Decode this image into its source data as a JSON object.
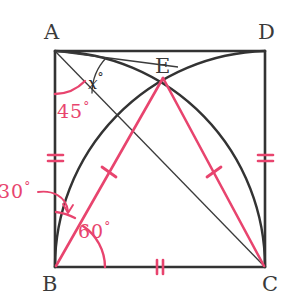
{
  "figure": {
    "type": "geometry-diagram",
    "colors": {
      "ink": "#333333",
      "accent_pink": "#e8446e",
      "background": "#ffffff"
    },
    "square": {
      "top_left": {
        "label": "A",
        "x": 55,
        "y": 51
      },
      "top_right": {
        "label": "D",
        "x": 265,
        "y": 51
      },
      "bottom_left": {
        "label": "B",
        "x": 55,
        "y": 267
      },
      "bottom_right": {
        "label": "C",
        "x": 265,
        "y": 267
      }
    },
    "point_e": {
      "label": "E",
      "x": 163,
      "y": 77
    },
    "vertex_labels": [
      {
        "name": "A",
        "text": "A",
        "x": 44,
        "y": 22
      },
      {
        "name": "D",
        "text": "D",
        "x": 258,
        "y": 22
      },
      {
        "name": "B",
        "text": "B",
        "x": 42,
        "y": 274
      },
      {
        "name": "C",
        "text": "C",
        "x": 262,
        "y": 274
      },
      {
        "name": "E",
        "text": "E",
        "x": 155,
        "y": 56
      }
    ],
    "angle_labels": [
      {
        "name": "x",
        "text": "x",
        "degree": "°",
        "x": 88,
        "y": 72,
        "color": "#2e2e2e",
        "at_vertex": "A"
      },
      {
        "name": "forty-five",
        "text": "45",
        "degree": "°",
        "x": 57,
        "y": 101,
        "color": "#e8446e",
        "at_vertex": "A"
      },
      {
        "name": "thirty",
        "text": "30",
        "degree": "°",
        "x": -2,
        "y": 181,
        "color": "#e8446e",
        "at_vertex": "B"
      },
      {
        "name": "sixty",
        "text": "60",
        "degree": "°",
        "x": 78,
        "y": 221,
        "color": "#e8446e",
        "at_vertex": "B"
      }
    ],
    "tick_marks": [
      {
        "name": "tick-ab",
        "segment": "AB",
        "count": 2,
        "x": 55,
        "y": 158
      },
      {
        "name": "tick-dc",
        "segment": "DC",
        "count": 2,
        "x": 265,
        "y": 158
      },
      {
        "name": "tick-bc",
        "segment": "BC",
        "count": 2,
        "x": 160,
        "y": 267
      },
      {
        "name": "tick-be",
        "segment": "BE",
        "count": 1,
        "x": 109,
        "y": 172
      },
      {
        "name": "tick-ec",
        "segment": "EC",
        "count": 1,
        "x": 214,
        "y": 172
      }
    ],
    "segments": [
      {
        "name": "side-ad",
        "from": "A",
        "to": "D",
        "color": "ink"
      },
      {
        "name": "side-ab",
        "from": "A",
        "to": "B",
        "color": "ink"
      },
      {
        "name": "side-bc",
        "from": "B",
        "to": "C",
        "color": "ink"
      },
      {
        "name": "side-dc",
        "from": "D",
        "to": "C",
        "color": "ink"
      },
      {
        "name": "diagonal-ac",
        "from": "A",
        "to": "C",
        "color": "ink"
      },
      {
        "name": "segment-ae",
        "from": "A",
        "to": "E",
        "color": "ink"
      },
      {
        "name": "segment-be",
        "from": "B",
        "to": "E",
        "color": "accent_pink"
      },
      {
        "name": "segment-ec",
        "from": "E",
        "to": "C",
        "color": "accent_pink"
      }
    ],
    "arcs": [
      {
        "name": "arc-a-to-c",
        "center": "B",
        "from": "A",
        "to": "C",
        "color": "ink"
      },
      {
        "name": "arc-b-to-d",
        "center": "C",
        "from": "B",
        "to": "D",
        "color": "ink"
      }
    ]
  }
}
